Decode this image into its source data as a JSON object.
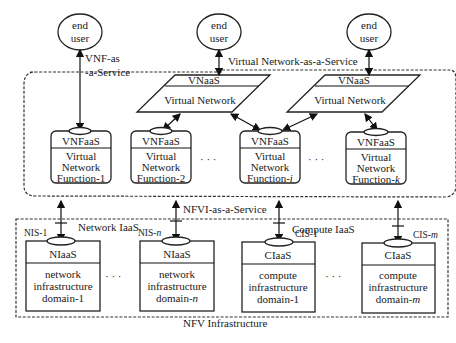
{
  "diagram": {
    "end_users": [
      {
        "line1": "end",
        "line2": "user"
      },
      {
        "line1": "end",
        "line2": "user"
      },
      {
        "line1": "end",
        "line2": "user"
      }
    ],
    "labels": {
      "vnf_as_a_service_1": "VNF-as",
      "vnf_as_a_service_2": "-a-Service",
      "vnaas_region": "Virtual Network-as-a-Service",
      "nfvi_as_a_service": "NFVI-as-a-Service",
      "network_iaas": "Network IaaS",
      "compute_iaas": "Compute IaaS",
      "nfv_infrastructure": "NFV Infrastructure",
      "ellipsis": "· · ·"
    },
    "vnaas": [
      {
        "header": "VNaaS",
        "body": "Virtual Network"
      },
      {
        "header": "VNaaS",
        "body": "Virtual Network"
      }
    ],
    "vnfs": [
      {
        "header": "VNFaaS",
        "l1": "Virtual",
        "l2": "Network",
        "l3": "Function-1"
      },
      {
        "header": "VNFaaS",
        "l1": "Virtual",
        "l2": "Network",
        "l3": "Function-2"
      },
      {
        "header": "VNFaaS",
        "l1": "Virtual",
        "l2": "Network",
        "l3": "Function-",
        "suffix": "i"
      },
      {
        "header": "VNFaaS",
        "l1": "Virtual",
        "l2": "Network",
        "l3": "Function-",
        "suffix": "k"
      }
    ],
    "infra": [
      {
        "port": "NIS-1",
        "header": "NIaaS",
        "l1": "network",
        "l2": "infrastructure",
        "l3": "domain-1",
        "suffix": ""
      },
      {
        "port": "NIS-",
        "port_suffix": "n",
        "header": "NIaaS",
        "l1": "network",
        "l2": "infrastructure",
        "l3": "domain-",
        "suffix": "n"
      },
      {
        "port": "CIS-1",
        "header": "CIaaS",
        "l1": "compute",
        "l2": "infrastructure",
        "l3": "domain-1",
        "suffix": ""
      },
      {
        "port": "CIS-",
        "port_suffix": "m",
        "header": "CIaaS",
        "l1": "compute",
        "l2": "infrastructure",
        "l3": "domain-",
        "suffix": "m"
      }
    ]
  }
}
